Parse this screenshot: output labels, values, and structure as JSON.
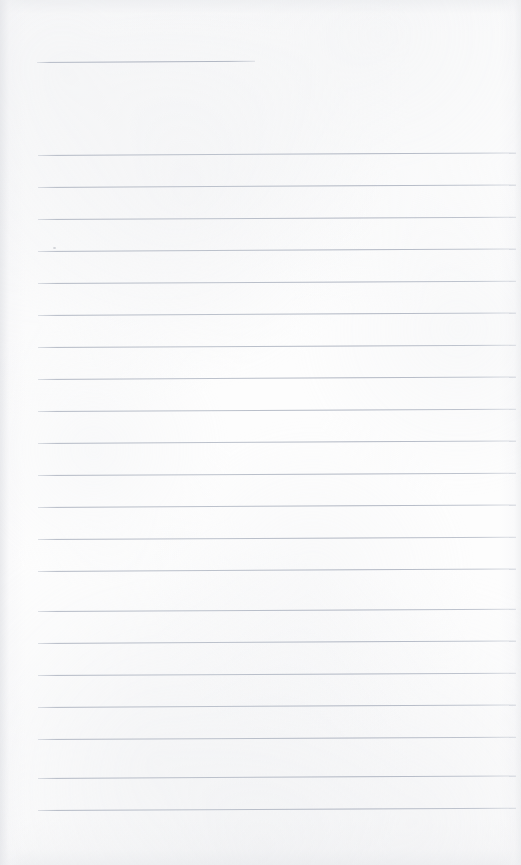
{
  "document": {
    "kind": "scanned-lined-paper",
    "title_text": "",
    "body_text": "",
    "page_width": 521,
    "page_height": 865,
    "paper_color": "#fdfdfd",
    "rule_color": "#b0b6c2",
    "edge_shadow_color": "#e8e9ec",
    "is_blank": true
  },
  "header_rule": {
    "name": "title-rule",
    "x": 37,
    "y": 62,
    "width": 218,
    "slant_deg": -0.35
  },
  "ruled_lines": [
    {
      "index": 1,
      "x": 38,
      "y": 155,
      "width": 478,
      "slant_deg": -0.3
    },
    {
      "index": 2,
      "x": 38,
      "y": 187,
      "width": 478,
      "slant_deg": -0.3
    },
    {
      "index": 3,
      "x": 38,
      "y": 219,
      "width": 478,
      "slant_deg": -0.28
    },
    {
      "index": 4,
      "x": 38,
      "y": 251,
      "width": 478,
      "slant_deg": -0.3
    },
    {
      "index": 5,
      "x": 38,
      "y": 283,
      "width": 478,
      "slant_deg": -0.28
    },
    {
      "index": 6,
      "x": 38,
      "y": 315,
      "width": 478,
      "slant_deg": -0.3
    },
    {
      "index": 7,
      "x": 38,
      "y": 347,
      "width": 478,
      "slant_deg": -0.28
    },
    {
      "index": 8,
      "x": 38,
      "y": 379,
      "width": 478,
      "slant_deg": -0.3
    },
    {
      "index": 9,
      "x": 38,
      "y": 411,
      "width": 478,
      "slant_deg": -0.28
    },
    {
      "index": 10,
      "x": 38,
      "y": 443,
      "width": 478,
      "slant_deg": -0.3
    },
    {
      "index": 11,
      "x": 38,
      "y": 475,
      "width": 478,
      "slant_deg": -0.28
    },
    {
      "index": 12,
      "x": 38,
      "y": 507,
      "width": 478,
      "slant_deg": -0.3
    },
    {
      "index": 13,
      "x": 38,
      "y": 539,
      "width": 478,
      "slant_deg": -0.28
    },
    {
      "index": 14,
      "x": 38,
      "y": 571,
      "width": 478,
      "slant_deg": -0.3
    },
    {
      "index": 15,
      "x": 38,
      "y": 611,
      "width": 478,
      "slant_deg": -0.28
    },
    {
      "index": 16,
      "x": 38,
      "y": 643,
      "width": 478,
      "slant_deg": -0.3
    },
    {
      "index": 17,
      "x": 38,
      "y": 675,
      "width": 478,
      "slant_deg": -0.28
    },
    {
      "index": 18,
      "x": 38,
      "y": 707,
      "width": 478,
      "slant_deg": -0.3
    },
    {
      "index": 19,
      "x": 38,
      "y": 739,
      "width": 478,
      "slant_deg": -0.28
    },
    {
      "index": 20,
      "x": 38,
      "y": 778,
      "width": 478,
      "slant_deg": -0.3
    },
    {
      "index": 21,
      "x": 38,
      "y": 810,
      "width": 478,
      "slant_deg": -0.28
    }
  ],
  "artifacts": [
    {
      "name": "scan-speck",
      "x": 53,
      "y": 247
    }
  ]
}
